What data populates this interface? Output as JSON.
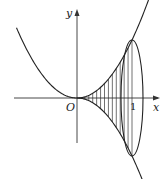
{
  "diagram": {
    "labels": {
      "x_axis": "x",
      "y_axis": "y",
      "origin": "O",
      "tick_one": "1"
    },
    "curves": [
      {
        "name": "upper-curve",
        "equation": "y = x^2"
      },
      {
        "name": "lower-curve",
        "equation": "y = -x^2",
        "domain": "x >= 0"
      }
    ],
    "ellipse": {
      "center_x": 1,
      "description": "cross-section disc at x = 1"
    },
    "hatching": {
      "from_x": 0,
      "to_x": 1,
      "style": "vertical lines"
    },
    "colors": {
      "stroke": "#222222",
      "background": "#ffffff"
    }
  }
}
